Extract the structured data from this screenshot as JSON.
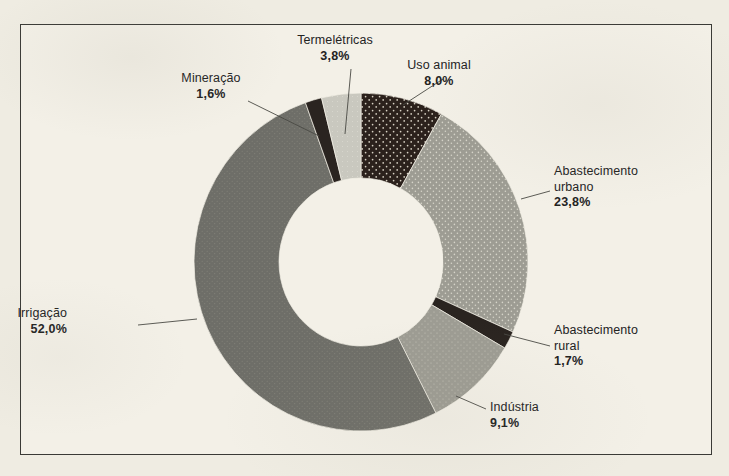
{
  "figure": {
    "background_color": "#efece2",
    "panel_color": "#f3f0e7",
    "frame_color": "#3a3a36"
  },
  "chart_data": {
    "type": "pie",
    "variant": "donut",
    "title": "",
    "subtitle": "",
    "xlabel": "",
    "ylabel": "",
    "legend_position": "none",
    "labels_inline": true,
    "value_suffix": "%",
    "decimal_separator": ",",
    "total": 100.0,
    "start_angle_deg": 0,
    "direction": "clockwise",
    "categories": [
      "Uso animal",
      "Abastecimento urbano",
      "Abastecimento rural",
      "Indústria",
      "Irrigação",
      "Mineração",
      "Termelétricas"
    ],
    "values": [
      8.0,
      23.8,
      1.7,
      9.1,
      52.0,
      1.6,
      3.8
    ],
    "value_labels": [
      "8,0%",
      "23,8%",
      "1,7%",
      "9,1%",
      "52,0%",
      "1,6%",
      "3,8%"
    ],
    "colors": [
      "#2b211c",
      "#9d9c93",
      "#2a2420",
      "#9d9c93",
      "#6e6e68",
      "#2a2420",
      "#c9c8bf"
    ],
    "slices": [
      {
        "name": "Uso animal",
        "value": 8.0,
        "value_label": "8,0%",
        "color": "#2b211c",
        "fill_pattern": "dark-speckled",
        "label_lines": [
          "Uso animal"
        ],
        "label_align": "center",
        "label_x": 438,
        "label_y": 57,
        "leader_from": [
          402,
          104
        ],
        "leader_to": [
          442,
          78
        ]
      },
      {
        "name": "Abastecimento urbano",
        "value": 23.8,
        "value_label": "23,8%",
        "color": "#9d9c93",
        "fill_pattern": "gray-speckled",
        "label_lines": [
          "Abastecimento",
          "urbano"
        ],
        "label_align": "left",
        "label_x": 553,
        "label_y": 163,
        "leader_from": [
          520,
          198
        ],
        "leader_to": [
          549,
          190
        ]
      },
      {
        "name": "Abastecimento rural",
        "value": 1.7,
        "value_label": "1,7%",
        "color": "#2a2420",
        "fill_pattern": "solid-dark",
        "label_lines": [
          "Abastecimento",
          "rural"
        ],
        "label_align": "left",
        "label_x": 553,
        "label_y": 322,
        "leader_from": [
          503,
          333
        ],
        "leader_to": [
          549,
          345
        ]
      },
      {
        "name": "Indústria",
        "value": 9.1,
        "value_label": "9,1%",
        "color": "#9d9c93",
        "fill_pattern": "gray-plain",
        "label_lines": [
          "Indústria"
        ],
        "label_align": "left",
        "label_x": 489,
        "label_y": 399,
        "leader_from": [
          455,
          395
        ],
        "leader_to": [
          485,
          408
        ]
      },
      {
        "name": "Irrigação",
        "value": 52.0,
        "value_label": "52,0%",
        "color": "#6e6e68",
        "fill_pattern": "dark-gray-plain",
        "label_lines": [
          "Irrigação"
        ],
        "label_align": "right",
        "label_x": 68,
        "label_y": 305,
        "leader_from": [
          196,
          318
        ],
        "leader_to": [
          137,
          324
        ]
      },
      {
        "name": "Mineração",
        "value": 1.6,
        "value_label": "1,6%",
        "color": "#2a2420",
        "fill_pattern": "solid-dark",
        "label_lines": [
          "Mineração"
        ],
        "label_align": "center",
        "label_x": 210,
        "label_y": 70,
        "leader_from": [
          318,
          135
        ],
        "leader_to": [
          247,
          100
        ]
      },
      {
        "name": "Termelétricas",
        "value": 3.8,
        "value_label": "3,8%",
        "color": "#c9c8bf",
        "fill_pattern": "light-gray",
        "label_lines": [
          "Termelétricas"
        ],
        "label_align": "center",
        "label_x": 334,
        "label_y": 32,
        "leader_from": [
          344,
          133
        ],
        "leader_to": [
          350,
          68
        ]
      }
    ],
    "geometry": {
      "center_x": 360,
      "center_y": 261,
      "outer_radius_x": 167,
      "outer_radius_y": 169,
      "inner_radius_x": 82,
      "inner_radius_y": 84
    }
  }
}
